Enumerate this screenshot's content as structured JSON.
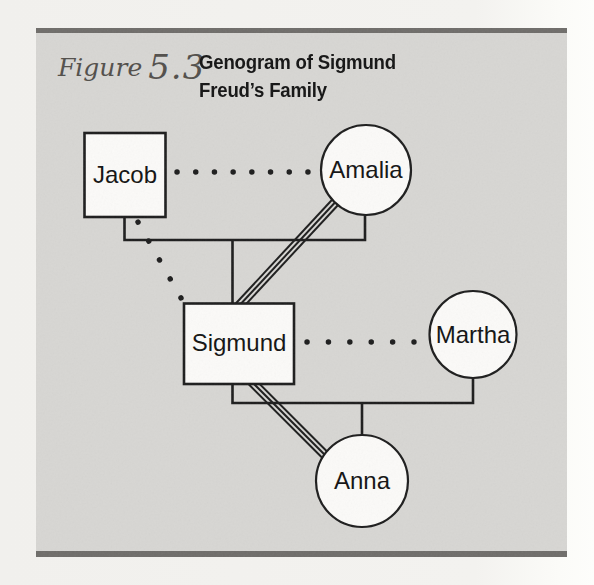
{
  "figure_header": {
    "figure_word": "Figure",
    "figure_number": "5.3",
    "title_line1": "Genogram of Sigmund",
    "title_line2": "Freud’s Family"
  },
  "genogram": {
    "nodes": [
      {
        "name": "Jacob",
        "shape": "square"
      },
      {
        "name": "Amalia",
        "shape": "circle"
      },
      {
        "name": "Sigmund",
        "shape": "square"
      },
      {
        "name": "Martha",
        "shape": "circle"
      },
      {
        "name": "Anna",
        "shape": "circle"
      }
    ],
    "connections": [
      {
        "between": [
          "Jacob",
          "Amalia"
        ],
        "style": "dotted"
      },
      {
        "between": [
          "Jacob",
          "Sigmund"
        ],
        "style": "dotted"
      },
      {
        "between": [
          "Amalia",
          "Sigmund"
        ],
        "style": "triple-line"
      },
      {
        "between": [
          "Sigmund",
          "Martha"
        ],
        "style": "dotted"
      },
      {
        "between": [
          "Sigmund",
          "Anna"
        ],
        "style": "triple-line"
      },
      {
        "between": [
          "Jacob+Amalia",
          "Sigmund"
        ],
        "style": "solid-descent"
      },
      {
        "between": [
          "Sigmund+Martha",
          "Anna"
        ],
        "style": "solid-descent"
      }
    ]
  },
  "colors": {
    "page_bg": "#f3f2ef",
    "panel_bg": "#d7d6d3",
    "bar": "#6f6d6a",
    "ink": "#1d1d1d",
    "node_fill": "#fbfaf8",
    "script": "#524f4b",
    "title": "#141414"
  }
}
